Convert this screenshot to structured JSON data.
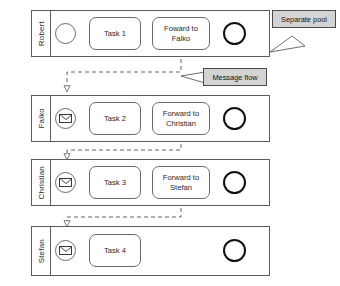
{
  "diagram": {
    "colors": {
      "pool_border": "#5b5b5b",
      "task_border": "#6a6a6a",
      "end_event_border": "#111111",
      "callout_fill": "#d4d4d4",
      "callout_border": "#4a4a4a",
      "canvas_background": "#ffffff"
    }
  },
  "pools": [
    {
      "id": "pool-robert",
      "label": "Robert",
      "start_event": {
        "type": "start-event",
        "name": "start-event"
      },
      "tasks": [
        {
          "id": "task-1",
          "label": "Task 1"
        },
        {
          "id": "task-forward-falko",
          "label": "Foward to\nFalko",
          "line1": "Foward to",
          "line2": "Falko"
        }
      ],
      "end_event": {
        "type": "end-event",
        "name": "end-event"
      }
    },
    {
      "id": "pool-falko",
      "label": "Falko",
      "start_event": {
        "type": "message-start-event",
        "name": "message-start-event"
      },
      "tasks": [
        {
          "id": "task-2",
          "label": "Task 2"
        },
        {
          "id": "task-forward-christian",
          "label": "Forward to\nChristian",
          "line1": "Forward to",
          "line2": "Christian"
        }
      ],
      "end_event": {
        "type": "end-event",
        "name": "end-event"
      }
    },
    {
      "id": "pool-christian",
      "label": "Christian",
      "start_event": {
        "type": "message-start-event",
        "name": "message-start-event"
      },
      "tasks": [
        {
          "id": "task-3",
          "label": "Task 3"
        },
        {
          "id": "task-forward-stefan",
          "label": "Forward to\nStefan",
          "line1": "Forward to",
          "line2": "Stefan"
        }
      ],
      "end_event": {
        "type": "end-event",
        "name": "end-event"
      }
    },
    {
      "id": "pool-stefan",
      "label": "Stefan",
      "start_event": {
        "type": "message-start-event",
        "name": "message-start-event"
      },
      "tasks": [
        {
          "id": "task-4",
          "label": "Task 4"
        }
      ],
      "end_event": {
        "type": "end-event",
        "name": "end-event"
      }
    }
  ],
  "annotations": [
    {
      "id": "annotation-separate-pool",
      "label": "Separate pool"
    },
    {
      "id": "annotation-message-flow",
      "label": "Message flow"
    }
  ]
}
